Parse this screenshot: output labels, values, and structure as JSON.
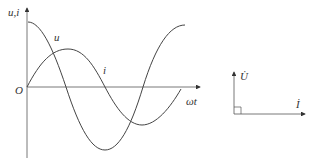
{
  "waveform": {
    "y_axis_label": "u,i",
    "x_axis_label": "ωt",
    "origin_label": "O",
    "curves": [
      {
        "name": "u",
        "label": "u",
        "phase_lead_deg": 90
      },
      {
        "name": "i",
        "label": "i",
        "phase_lead_deg": 0
      }
    ]
  },
  "phasor": {
    "voltage_label": "U̇",
    "current_label": "İ",
    "angle_marker": "right-angle"
  },
  "colors": {
    "line": "#444444",
    "background": "#ffffff"
  }
}
